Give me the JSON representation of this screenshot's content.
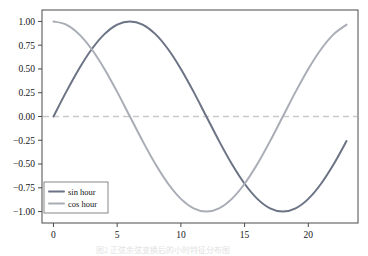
{
  "figure": {
    "background": "#ffffff",
    "frame_color": "#4a4a4a",
    "caption_clipped": "图2 正弦余弦变换后的小时特征分布图"
  },
  "chart_data": {
    "type": "line",
    "title": "",
    "xlabel": "",
    "ylabel": "",
    "xlim": [
      -0.9,
      23.9
    ],
    "ylim": [
      -1.12,
      1.12
    ],
    "grid": false,
    "legend_position": "lower left",
    "xticks": [
      0,
      5,
      10,
      15,
      20
    ],
    "xtick_labels": [
      "0",
      "5",
      "10",
      "15",
      "20"
    ],
    "yticks": [
      1.0,
      0.75,
      0.5,
      0.25,
      0.0,
      -0.25,
      -0.5,
      -0.75,
      -1.0
    ],
    "ytick_labels": [
      "1.00",
      "0.75",
      "0.50",
      "0.25",
      "0.00",
      "−0.25",
      "−0.50",
      "−0.75",
      "−1.00"
    ],
    "reference_lines": [
      {
        "orientation": "horizontal",
        "value": 0.0,
        "style": "dashed",
        "color": "#c9c9c9"
      }
    ],
    "x": [
      0,
      1,
      2,
      3,
      4,
      5,
      6,
      7,
      8,
      9,
      10,
      11,
      12,
      13,
      14,
      15,
      16,
      17,
      18,
      19,
      20,
      21,
      22,
      23
    ],
    "series": [
      {
        "name": "sin hour",
        "color": "#6b7385",
        "linewidth": 2.0,
        "values": [
          0.0,
          0.2588,
          0.5,
          0.7071,
          0.866,
          0.9659,
          1.0,
          0.9659,
          0.866,
          0.7071,
          0.5,
          0.2588,
          0.0,
          -0.2588,
          -0.5,
          -0.7071,
          -0.866,
          -0.9659,
          -1.0,
          -0.9659,
          -0.866,
          -0.7071,
          -0.5,
          -0.2588
        ]
      },
      {
        "name": "cos hour",
        "color": "#a9adb5",
        "linewidth": 2.0,
        "values": [
          1.0,
          0.9659,
          0.866,
          0.7071,
          0.5,
          0.2588,
          0.0,
          -0.2588,
          -0.5,
          -0.7071,
          -0.866,
          -0.9659,
          -1.0,
          -0.9659,
          -0.866,
          -0.7071,
          -0.5,
          -0.2588,
          0.0,
          0.2588,
          0.5,
          0.7071,
          0.866,
          0.9659
        ]
      }
    ]
  },
  "legend": {
    "entries": [
      {
        "label": "sin hour"
      },
      {
        "label": "cos hour"
      }
    ]
  }
}
